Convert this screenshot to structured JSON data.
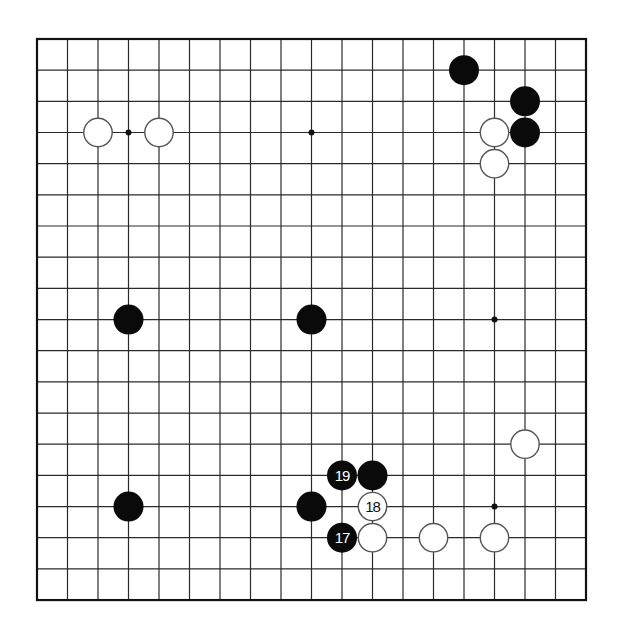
{
  "board": {
    "size": 19,
    "origin": {
      "x": 37,
      "y": 39
    },
    "spacing": {
      "x": 30.5,
      "y": 31.17
    },
    "line_color": "#2a2a2a",
    "border_color": "#111111",
    "background": "#ffffff",
    "star_points": [
      [
        3,
        3
      ],
      [
        9,
        3
      ],
      [
        15,
        9
      ],
      [
        15,
        15
      ]
    ],
    "stone_radius": 15
  },
  "stones": [
    {
      "color": "black",
      "col": 14,
      "row": 1,
      "label": ""
    },
    {
      "color": "black",
      "col": 16,
      "row": 2,
      "label": ""
    },
    {
      "color": "black",
      "col": 16,
      "row": 3,
      "label": ""
    },
    {
      "color": "white",
      "col": 15,
      "row": 3,
      "label": ""
    },
    {
      "color": "white",
      "col": 15,
      "row": 4,
      "label": ""
    },
    {
      "color": "white",
      "col": 2,
      "row": 3,
      "label": ""
    },
    {
      "color": "white",
      "col": 4,
      "row": 3,
      "label": ""
    },
    {
      "color": "black",
      "col": 3,
      "row": 9,
      "label": ""
    },
    {
      "color": "black",
      "col": 9,
      "row": 9,
      "label": ""
    },
    {
      "color": "white",
      "col": 16,
      "row": 13,
      "label": ""
    },
    {
      "color": "black",
      "col": 10,
      "row": 14,
      "label": "19"
    },
    {
      "color": "black",
      "col": 11,
      "row": 14,
      "label": ""
    },
    {
      "color": "black",
      "col": 3,
      "row": 15,
      "label": ""
    },
    {
      "color": "black",
      "col": 9,
      "row": 15,
      "label": ""
    },
    {
      "color": "white",
      "col": 11,
      "row": 15,
      "label": "18"
    },
    {
      "color": "black",
      "col": 10,
      "row": 16,
      "label": "17"
    },
    {
      "color": "white",
      "col": 11,
      "row": 16,
      "label": ""
    },
    {
      "color": "white",
      "col": 13,
      "row": 16,
      "label": ""
    },
    {
      "color": "white",
      "col": 15,
      "row": 16,
      "label": ""
    }
  ]
}
